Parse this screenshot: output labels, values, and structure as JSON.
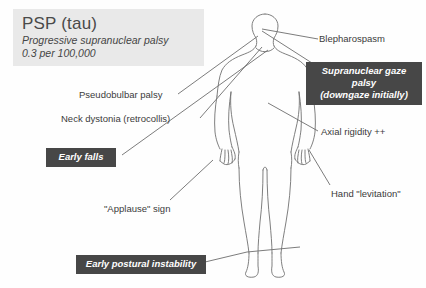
{
  "canvas": {
    "width": 426,
    "height": 288,
    "background": "#ffffff"
  },
  "title_card": {
    "heading": "PSP (tau)",
    "subtitle": "Progressive supranuclear palsy",
    "prevalence": "0.3 per 100,000",
    "background": "#e9e9e9",
    "text_color": "#4a4a4a"
  },
  "figure": {
    "name": "human-body-silhouette",
    "stroke": "#6e6e6e",
    "fill": "#ffffff"
  },
  "plain_labels": [
    {
      "id": "blepharospasm",
      "text": "Blepharospasm"
    },
    {
      "id": "pseudobulbar-palsy",
      "text": "Pseudobulbar palsy"
    },
    {
      "id": "neck-dystonia",
      "text": "Neck dystonia (retrocollis)"
    },
    {
      "id": "axial-rigidity",
      "text": "Axial rigidity ++"
    },
    {
      "id": "hand-levitation",
      "text": "Hand \"levitation\""
    },
    {
      "id": "applause-sign",
      "text": "\"Applause\" sign"
    }
  ],
  "callout_boxes": [
    {
      "id": "supranuclear-gaze-palsy",
      "lines": [
        "Supranuclear gaze",
        "palsy",
        "(downgaze initially)"
      ],
      "background": "#474747",
      "text_color": "#ffffff"
    },
    {
      "id": "early-falls",
      "lines": [
        "Early falls"
      ],
      "background": "#474747",
      "text_color": "#ffffff"
    },
    {
      "id": "early-postural-instability",
      "lines": [
        "Early postural instability"
      ],
      "background": "#474747",
      "text_color": "#ffffff"
    }
  ],
  "leader_lines": {
    "stroke": "#5a5a5a",
    "count": 8,
    "description": "thin straight pointer lines connecting each label to an anatomical site on the figure"
  }
}
